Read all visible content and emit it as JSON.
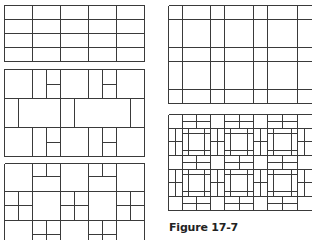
{
  "figure": {
    "caption": "Figure 17-7",
    "line_color": "#3a3a3a",
    "panels": [
      {
        "id": "panel-1",
        "description": "running bond grid, 5 columns x 4 rows"
      },
      {
        "id": "panel-2",
        "description": "offset block pattern with half-split bricks"
      },
      {
        "id": "panel-3",
        "description": "square and split-rectangle pattern"
      },
      {
        "id": "panel-4",
        "description": "plaid grid with narrow bands"
      },
      {
        "id": "panel-5",
        "description": "basketweave pinwheel pattern"
      }
    ]
  }
}
